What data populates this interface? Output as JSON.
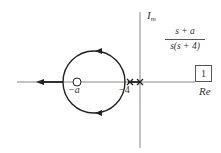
{
  "diagram": {
    "type": "root-locus",
    "note": "Positions are approximate, estimated from zoomed views. The -a zero is drawn to the left of the -4 pole, implying a > 4; the numeric value of a is not given in the figure.",
    "colors": {
      "axis": "#888888",
      "locus": "#222222",
      "text": "#333333"
    },
    "axes": {
      "imaginary_label_main": "I",
      "imaginary_label_sub": "m",
      "real_label": "Re"
    },
    "transfer_function": {
      "numerator": "s + a",
      "denominator": "s(s + 4)"
    },
    "gain_block": {
      "value": "1"
    },
    "poles": [
      {
        "label": "−4",
        "symbol": "x",
        "position": "-4"
      },
      {
        "label": "",
        "symbol": "x",
        "position": "0"
      }
    ],
    "zeros": [
      {
        "label": "−a",
        "symbol": "o",
        "position": "-a"
      }
    ],
    "locus_segments": [
      {
        "kind": "circle",
        "description": "circle centered near -a on real axis, arrows pointing counterclockwise"
      },
      {
        "kind": "ray",
        "description": "real axis to the left of the circle, arrow pointing toward -infinity"
      }
    ]
  }
}
